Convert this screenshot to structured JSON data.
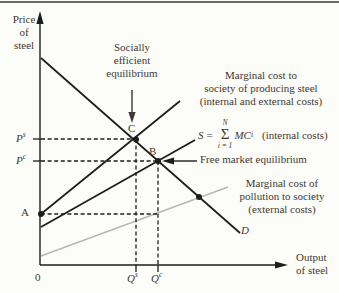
{
  "figure": {
    "axes": {
      "y_label_lines": [
        "Price",
        "of",
        "steel"
      ],
      "x_label_lines": [
        "Output",
        "of steel"
      ],
      "origin": "0"
    },
    "points": {
      "ps": {
        "base": "P",
        "sup": "s"
      },
      "pc": {
        "base": "P",
        "sup": "c"
      },
      "qs": {
        "base": "Q",
        "sup": "s"
      },
      "qc": {
        "base": "Q",
        "sup": "c"
      },
      "a": "A",
      "b": "B",
      "c": "C",
      "d": "D"
    },
    "annotations": {
      "socially_efficient": [
        "Socially",
        "efficient",
        "equilibrium"
      ],
      "marginal_social": [
        "Marginal cost to",
        "society of producing steel",
        "(internal and external costs)"
      ],
      "free_market": "Free market equilibrium",
      "marginal_pollution": [
        "Marginal cost of",
        "pollution to society",
        "(external costs)"
      ],
      "formula": {
        "lhs": "S",
        "eq": "=",
        "sum_top": "N",
        "sigma": "Σ",
        "sum_bottom": "i = 1",
        "mc": "MC",
        "mc_sub": "i",
        "note": "(internal costs)"
      }
    },
    "colors": {
      "curve": "#1d1d1d",
      "external_cost_line": "#b9b7b0",
      "text": "#3f3833"
    }
  }
}
